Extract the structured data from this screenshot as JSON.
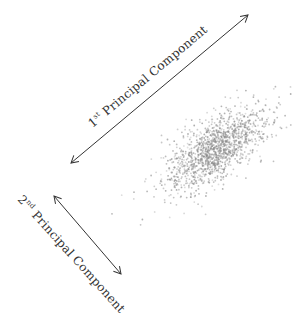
{
  "diagram": {
    "title": "",
    "background": "#ffffff",
    "point_color": "#8a8a8a",
    "arrow_color": "#333333",
    "pc1": {
      "ordinal": "1",
      "suffix": "st",
      "label": "Principal Component",
      "arrow": {
        "x1": 71,
        "y1": 163,
        "x2": 248,
        "y2": 15
      }
    },
    "pc2": {
      "ordinal": "2",
      "suffix": "nd",
      "label": "Principal Component",
      "arrow": {
        "x1": 54,
        "y1": 196,
        "x2": 121,
        "y2": 274
      }
    },
    "scatter": {
      "center": [
        215,
        150
      ],
      "angle_deg": -37,
      "sd_major": 30,
      "sd_minor": 13,
      "count": 1400
    }
  }
}
